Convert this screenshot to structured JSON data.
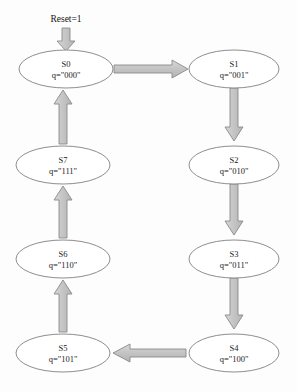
{
  "diagram": {
    "reset": {
      "label": "Reset=1",
      "target": "S0"
    },
    "states": [
      {
        "id": "S0",
        "name": "S0",
        "value": "q=\"000\"",
        "cx": 66,
        "cy": 69
      },
      {
        "id": "S1",
        "name": "S1",
        "value": "q=\"001\"",
        "cx": 234,
        "cy": 69
      },
      {
        "id": "S2",
        "name": "S2",
        "value": "q=\"010\"",
        "cx": 234,
        "cy": 165
      },
      {
        "id": "S3",
        "name": "S3",
        "value": "q=\"011\"",
        "cx": 234,
        "cy": 259
      },
      {
        "id": "S4",
        "name": "S4",
        "value": "q=\"100\"",
        "cx": 234,
        "cy": 353
      },
      {
        "id": "S5",
        "name": "S5",
        "value": "q=\"101\"",
        "cx": 63,
        "cy": 353
      },
      {
        "id": "S6",
        "name": "S6",
        "value": "q=\"110\"",
        "cx": 63,
        "cy": 259
      },
      {
        "id": "S7",
        "name": "S7",
        "value": "q=\"111\"",
        "cx": 63,
        "cy": 165
      }
    ],
    "transitions": [
      {
        "from": "S0",
        "to": "S1",
        "direction": "right"
      },
      {
        "from": "S1",
        "to": "S2",
        "direction": "down"
      },
      {
        "from": "S2",
        "to": "S3",
        "direction": "down"
      },
      {
        "from": "S3",
        "to": "S4",
        "direction": "down"
      },
      {
        "from": "S4",
        "to": "S5",
        "direction": "left"
      },
      {
        "from": "S5",
        "to": "S6",
        "direction": "up"
      },
      {
        "from": "S6",
        "to": "S7",
        "direction": "up"
      },
      {
        "from": "S7",
        "to": "S0",
        "direction": "up"
      }
    ],
    "colors": {
      "background": "#fdfdfd",
      "ellipse_stroke": "#8e8e8e",
      "ellipse_fill": "#ffffff",
      "arrow_fill": "#c6c6c6",
      "arrow_stroke": "#8a8a8a",
      "text": "#1c1c1c"
    },
    "geometry": {
      "ellipse_rx": 47,
      "ellipse_ry": 19
    }
  }
}
